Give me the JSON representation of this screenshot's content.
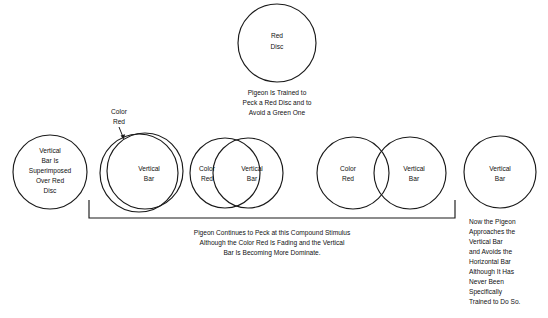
{
  "figure": {
    "background_color": "#ffffff",
    "line_color": "#1a1a1a",
    "top_circle": {
      "label_line1": "Red",
      "label_line2": "Disc"
    },
    "top_caption": {
      "line1": "Pigeon Is Trained to",
      "line2": "Peck a Red Disc and to",
      "line3": "Avoid a Green One"
    },
    "stages": [
      {
        "name": "stage-1-superimposed",
        "labels": [
          "Vertical",
          "Bar Is",
          "Superimposed",
          "Over Red",
          "Disc"
        ]
      },
      {
        "name": "stage-2-near-total-overlap",
        "callout_line1": "Color",
        "callout_line2": "Red",
        "inner_label_line1": "Vertical",
        "inner_label_line2": "Bar"
      },
      {
        "name": "stage-3-heavy-overlap",
        "left_label_line1": "Color",
        "left_label_line2": "Red",
        "right_label_line1": "Vertical",
        "right_label_line2": "Bar"
      },
      {
        "name": "stage-4-partial-overlap",
        "left_label_line1": "Color",
        "left_label_line2": "Red",
        "right_label_line1": "Vertical",
        "right_label_line2": "Bar"
      },
      {
        "name": "stage-5-vertical-bar-only",
        "label_line1": "Vertical",
        "label_line2": "Bar"
      }
    ],
    "bottom_caption": {
      "line1": "Pigeon Continues to Peck at this Compound Stimulus",
      "line2": "Although the Color Red Is Fading and the Vertical",
      "line3": "Bar Is Becoming More Dominate."
    },
    "right_caption": {
      "line1": "Now the Pigeon",
      "line2": "Approaches the",
      "line3": "Vertical Bar",
      "line4": "and Avoids the",
      "line5": "Horizontal Bar",
      "line6": "Although It Has",
      "line7": "Never Been",
      "line8": "Specifically",
      "line9": "Trained to Do So."
    }
  }
}
